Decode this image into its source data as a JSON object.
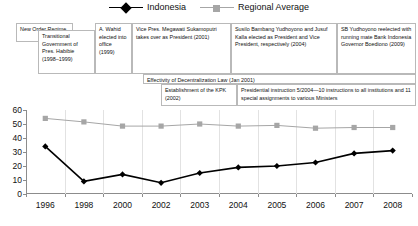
{
  "legend": {
    "entries": [
      {
        "label": "Indonesia",
        "color": "#000000",
        "marker": "diamond"
      },
      {
        "label": "Regional Average",
        "color": "#a6a6a6",
        "marker": "square"
      }
    ]
  },
  "annotations": [
    {
      "id": "new-order-regime",
      "text": "New Order Regime",
      "x": 16,
      "y": 23,
      "w": 57,
      "h": 19
    },
    {
      "id": "transitional-government",
      "text": "Transitional Government of Pres. Habibie (1998–1999)",
      "x": 38,
      "y": 30,
      "w": 57,
      "h": 44
    },
    {
      "id": "wahid-elected",
      "text": "A. Wahid elected into office (1999)",
      "x": 95,
      "y": 23,
      "w": 37,
      "h": 51
    },
    {
      "id": "megawati-president",
      "text": "Vice Pres. Megawati Sukamoputri takes over as President (2001)",
      "x": 132,
      "y": 23,
      "w": 99,
      "h": 51
    },
    {
      "id": "sby-jk-elected",
      "text": "Susilo Bambang Yudhoyono and Jusuf Kalla elected as President and Vice President, respectively (2004)",
      "x": 231,
      "y": 23,
      "w": 106,
      "h": 51
    },
    {
      "id": "sby-reelected",
      "text": "SB Yudhoyono reelected with running mate Bank Indonesia Governor Boediono (2009)",
      "x": 337,
      "y": 23,
      "w": 79,
      "h": 51
    },
    {
      "id": "decentralization-law",
      "text": "Effectivity of Decentralization Law (Jan 2001)",
      "x": 143,
      "y": 74,
      "w": 273,
      "h": 10
    },
    {
      "id": "kpk-establishment",
      "text": "Establishment of the KPK (2002)",
      "x": 161,
      "y": 84,
      "w": 76,
      "h": 22
    },
    {
      "id": "presidential-instruction",
      "text": "Presidential instruction 5/2004—10 instructions to all institutions and 11 special assignments to various Ministers",
      "x": 237,
      "y": 84,
      "w": 179,
      "h": 22
    }
  ],
  "chart_data": {
    "type": "line",
    "title": "",
    "xlabel": "",
    "ylabel": "",
    "categories": [
      "1996",
      "1998",
      "2000",
      "2002",
      "2003",
      "2004",
      "2005",
      "2006",
      "2007",
      "2008"
    ],
    "yticks": [
      0,
      10,
      20,
      30,
      40,
      50,
      60
    ],
    "ylim": [
      0,
      60
    ],
    "grid": "vertical",
    "legend_position": "top-center",
    "series": [
      {
        "name": "Indonesia",
        "color": "#000000",
        "marker": "diamond",
        "values": [
          34,
          9,
          14,
          8,
          15,
          19,
          20,
          22.5,
          29,
          31
        ]
      },
      {
        "name": "Regional Average",
        "color": "#a6a6a6",
        "marker": "square",
        "values": [
          54,
          51.5,
          48.5,
          48.5,
          50,
          48.5,
          49,
          47,
          47.5,
          47.5
        ]
      }
    ]
  }
}
